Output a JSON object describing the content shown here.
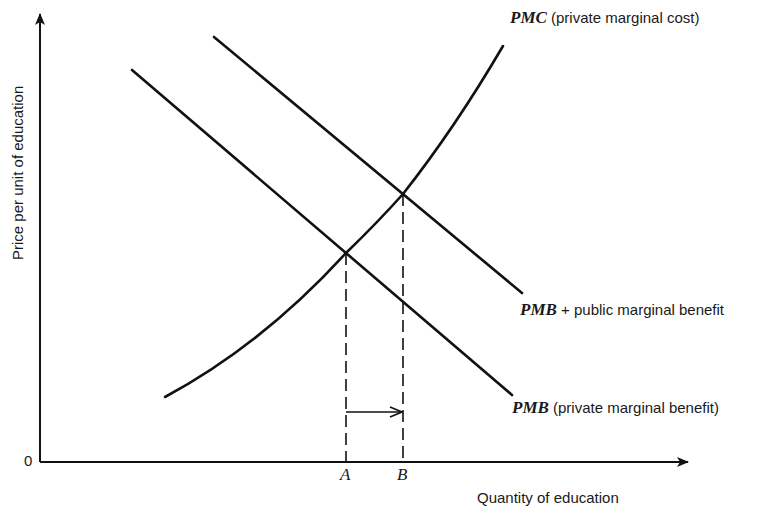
{
  "diagram": {
    "type": "economics-supply-demand",
    "axes": {
      "y_label": "Price per unit of education",
      "x_label": "Quantity of education",
      "origin": "0"
    },
    "curves": {
      "pmc": {
        "abbr": "PMC",
        "desc": "(private marginal cost)"
      },
      "pmb_public": {
        "abbr": "PMB",
        "desc": "+ public marginal benefit"
      },
      "pmb": {
        "abbr": "PMB",
        "desc": "(private marginal benefit)"
      }
    },
    "points": {
      "a": "A",
      "b": "B"
    },
    "colors": {
      "line": "#111111",
      "text": "#1a1a1a",
      "background": "#ffffff"
    }
  }
}
